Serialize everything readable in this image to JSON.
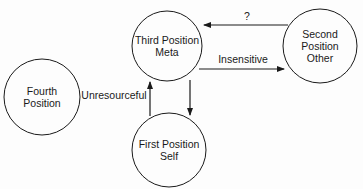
{
  "diagram": {
    "type": "state-transition",
    "colors": {
      "stroke": "#1a1a1a",
      "text": "#1a1a1a",
      "background": "#fdfdfd"
    },
    "nodes": [
      {
        "id": "third",
        "line1": "Third Position",
        "line2": "Meta",
        "cx": 167,
        "cy": 46,
        "r": 35
      },
      {
        "id": "second",
        "line1": "Second",
        "line2": "Position",
        "line3": "Other",
        "cx": 320,
        "cy": 46,
        "r": 37
      },
      {
        "id": "fourth",
        "line1": "Fourth",
        "line2": "Position",
        "cx": 42,
        "cy": 97,
        "r": 38
      },
      {
        "id": "first",
        "line1": "First Position",
        "line2": "Self",
        "cx": 169,
        "cy": 150,
        "r": 37
      }
    ],
    "edges": [
      {
        "from": "second",
        "to": "third",
        "label": "?"
      },
      {
        "from": "third",
        "to": "second",
        "label": "Insensitive"
      },
      {
        "from": "first",
        "to": "third",
        "label": "Unresourceful"
      },
      {
        "from": "third",
        "to": "first",
        "label": ""
      }
    ]
  }
}
